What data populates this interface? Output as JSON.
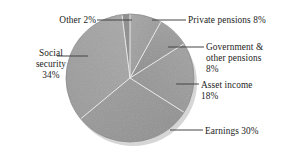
{
  "chart_data": {
    "type": "pie",
    "title": "",
    "subtitle": "",
    "xlabel": "",
    "ylabel": "",
    "legend_position": "callout-labels",
    "grid": false,
    "total_percent": 100,
    "categories": [
      "Private pensions",
      "Government & other pensions",
      "Asset income",
      "Earnings",
      "Social security",
      "Other"
    ],
    "values": [
      8,
      8,
      18,
      30,
      34,
      2
    ],
    "units": "%",
    "slices": [
      {
        "label": "Private pensions",
        "value": 8,
        "value_text": "8%",
        "start_deg": 0,
        "end_deg": 28.8,
        "color": "#9d9d9d"
      },
      {
        "label": "Government & other pensions",
        "value": 8,
        "value_text": "8%",
        "start_deg": 28.8,
        "end_deg": 57.6,
        "color": "#969696"
      },
      {
        "label": "Asset income",
        "value": 18,
        "value_text": "18%",
        "start_deg": 57.6,
        "end_deg": 122.4,
        "color": "#9a9a9a"
      },
      {
        "label": "Earnings",
        "value": 30,
        "value_text": "30%",
        "start_deg": 122.4,
        "end_deg": 230.4,
        "color": "#929292"
      },
      {
        "label": "Social security",
        "value": 34,
        "value_text": "34%",
        "start_deg": 230.4,
        "end_deg": 352.8,
        "color": "#a0a0a0"
      },
      {
        "label": "Other",
        "value": 2,
        "value_text": "2%",
        "start_deg": 352.8,
        "end_deg": 360,
        "color": "#8c8c8c"
      }
    ]
  },
  "labels": {
    "other": "Other  2%",
    "social_security_line1": "Social",
    "social_security_line2": "security",
    "social_security_line3": "34%",
    "private_pensions": "Private pensions  8%",
    "government_pensions_line1": "Government &",
    "government_pensions_line2": "other pensions",
    "government_pensions_line3": "8%",
    "asset_income_line1": "Asset income",
    "asset_income_line2": "18%",
    "earnings": "Earnings  30%"
  },
  "style": {
    "background": "#ffffff",
    "text_color": "#1b1b1b",
    "pie_fill": "#9a9a9a",
    "divider_color": "#e8e8e8",
    "leader_color": "#3a3a3a",
    "shadow_color": "#d8d8d8"
  }
}
